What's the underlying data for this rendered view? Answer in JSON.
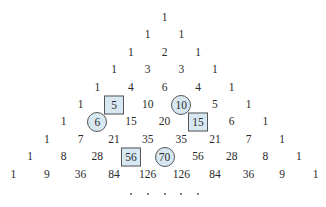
{
  "rows": [
    [
      1
    ],
    [
      1,
      1
    ],
    [
      1,
      2,
      1
    ],
    [
      1,
      3,
      3,
      1
    ],
    [
      1,
      4,
      6,
      4,
      1
    ],
    [
      1,
      5,
      10,
      10,
      5,
      1
    ],
    [
      1,
      6,
      15,
      20,
      15,
      6,
      1
    ],
    [
      1,
      7,
      21,
      35,
      35,
      21,
      7,
      1
    ],
    [
      1,
      8,
      28,
      56,
      70,
      56,
      28,
      8,
      1
    ],
    [
      1,
      9,
      36,
      84,
      126,
      126,
      84,
      36,
      9,
      1
    ]
  ],
  "highlights": {
    "boxed": [
      [
        5,
        1
      ],
      [
        6,
        4
      ],
      [
        8,
        3
      ]
    ],
    "circled": [
      [
        5,
        3
      ],
      [
        6,
        1
      ],
      [
        8,
        4
      ]
    ]
  },
  "continuation": ". . . . .",
  "colors": {
    "highlight_fill": "#d8e8f3",
    "highlight_border": "#555555",
    "text": "#2a2a2a"
  }
}
